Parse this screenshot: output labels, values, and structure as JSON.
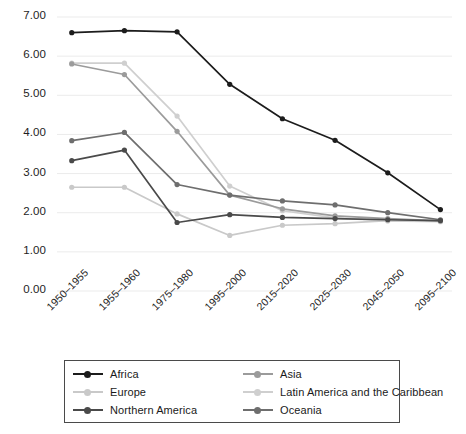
{
  "chart_data": {
    "type": "line",
    "title": "",
    "xlabel": "",
    "ylabel": "",
    "categories": [
      "1950–1955",
      "1955–1960",
      "1975–1980",
      "1995–2000",
      "2015–2020",
      "2025–2030",
      "2045–2050",
      "2095–2100"
    ],
    "ylim": [
      0.0,
      7.0
    ],
    "ytick_labels": [
      "0.00",
      "1.00",
      "2.00",
      "3.00",
      "4.00",
      "5.00",
      "6.00",
      "7.00"
    ],
    "ytick_values": [
      0.0,
      1.0,
      2.0,
      3.0,
      4.0,
      5.0,
      6.0,
      7.0
    ],
    "grid": true,
    "legend_position": "bottom",
    "series": [
      {
        "name": "Africa",
        "color": "#1c1c1c",
        "values": [
          6.6,
          6.65,
          6.62,
          5.28,
          4.4,
          3.85,
          3.02,
          2.08
        ]
      },
      {
        "name": "Asia",
        "color": "#9b9b9b",
        "values": [
          5.8,
          5.53,
          4.08,
          2.45,
          2.1,
          1.92,
          1.85,
          1.79
        ]
      },
      {
        "name": "Europe",
        "color": "#c9c9c9",
        "values": [
          2.65,
          2.65,
          1.97,
          1.42,
          1.68,
          1.72,
          1.8,
          1.79
        ]
      },
      {
        "name": "Latin America and the Caribbean",
        "color": "#cfcfcf",
        "values": [
          5.82,
          5.82,
          4.47,
          2.68,
          2.05,
          1.87,
          1.79,
          1.77
        ]
      },
      {
        "name": "Northern America",
        "color": "#4a4a4a",
        "values": [
          3.33,
          3.6,
          1.75,
          1.95,
          1.88,
          1.85,
          1.82,
          1.8
        ]
      },
      {
        "name": "Oceania",
        "color": "#6e6e6e",
        "values": [
          3.84,
          4.05,
          2.72,
          2.45,
          2.3,
          2.2,
          2.0,
          1.82
        ]
      }
    ]
  },
  "legend": {
    "entries": [
      {
        "label": "Africa",
        "color": "#1c1c1c"
      },
      {
        "label": "Asia",
        "color": "#9b9b9b"
      },
      {
        "label": "Europe",
        "color": "#c9c9c9"
      },
      {
        "label": "Latin America and the Caribbean",
        "color": "#cfcfcf"
      },
      {
        "label": "Northern America",
        "color": "#4a4a4a"
      },
      {
        "label": "Oceania",
        "color": "#6e6e6e"
      }
    ]
  },
  "axes": {
    "plot_left": 57,
    "plot_right": 452,
    "plot_top": 17,
    "plot_bottom": 291,
    "gridline_color": "#ebebeb"
  }
}
